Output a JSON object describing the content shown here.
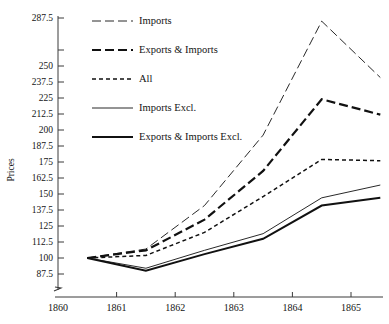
{
  "chart_data": {
    "type": "line",
    "title": "",
    "xlabel": "",
    "ylabel": "Prices",
    "x": [
      1860.5,
      1861.5,
      1862.5,
      1863.5,
      1864.5,
      1865.5
    ],
    "xlim": [
      1860,
      1866
    ],
    "ylim": [
      80,
      292
    ],
    "x_tick_labels": [
      "1860",
      "1861",
      "1862",
      "1863",
      "1864",
      "1865"
    ],
    "x_ticks": [
      1860,
      1861,
      1862,
      1863,
      1864,
      1865
    ],
    "y_ticks": [
      87.5,
      100,
      112.5,
      125,
      137.5,
      150,
      162.5,
      175,
      187.5,
      200,
      212.5,
      225,
      237.5,
      250,
      262.5,
      287.5
    ],
    "y_tick_labels": [
      "87.5",
      "100",
      "112.5",
      "125",
      "137.5",
      "150",
      "162.5",
      "175",
      "187.5",
      "200",
      "212.5",
      "225",
      "237.5",
      "250",
      "",
      "287.5"
    ],
    "grid": false,
    "legend_position": "upper-left",
    "series": [
      {
        "name": "Imports",
        "style": "long-dash-thin",
        "stroke_width": 0.9,
        "dasharray": "9 4",
        "values": [
          100,
          107,
          141,
          196,
          285,
          241
        ]
      },
      {
        "name": "Exports & Imports",
        "style": "long-dash-thick",
        "stroke_width": 2.2,
        "dasharray": "9 4",
        "values": [
          100,
          106,
          130,
          168,
          224,
          212
        ]
      },
      {
        "name": "All",
        "style": "short-dash-thin",
        "stroke_width": 1.5,
        "dasharray": "4 3",
        "values": [
          100,
          102,
          120,
          148,
          177,
          176
        ]
      },
      {
        "name": "Imports Excl.",
        "style": "solid-thin",
        "stroke_width": 0.9,
        "dasharray": "none",
        "values": [
          100,
          92,
          106,
          119,
          147,
          157
        ]
      },
      {
        "name": "Exports & Imports Excl.",
        "style": "solid-thick",
        "stroke_width": 2.0,
        "dasharray": "none",
        "values": [
          100,
          90,
          103,
          115,
          141,
          147
        ]
      }
    ]
  },
  "legend": {
    "items": [
      {
        "label": "Imports"
      },
      {
        "label": "Exports & Imports"
      },
      {
        "label": "All"
      },
      {
        "label": "Imports Excl."
      },
      {
        "label": "Exports & Imports Excl."
      }
    ]
  },
  "axes": {
    "y_title": "Prices"
  },
  "colors": {
    "line": "#111111",
    "axis": "#3a3a3a",
    "background": "#ffffff"
  }
}
